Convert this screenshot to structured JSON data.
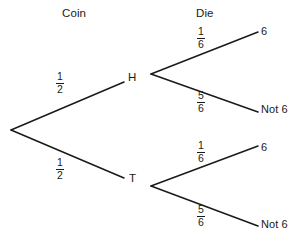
{
  "diagram": {
    "type": "probability-tree",
    "title_columns": [
      {
        "id": "coin",
        "label": "Coin"
      },
      {
        "id": "die",
        "label": "Die"
      }
    ],
    "nodes": {
      "root": {
        "label": ""
      },
      "heads": {
        "label": "H"
      },
      "tails": {
        "label": "T"
      },
      "h_six": {
        "label": "6"
      },
      "h_not_six": {
        "label": "Not 6"
      },
      "t_six": {
        "label": "6"
      },
      "t_not_six": {
        "label": "Not 6"
      }
    },
    "branches": [
      {
        "id": "root-heads",
        "numerator": "1",
        "denominator": "2"
      },
      {
        "id": "root-tails",
        "numerator": "1",
        "denominator": "2"
      },
      {
        "id": "heads-six",
        "numerator": "1",
        "denominator": "6"
      },
      {
        "id": "heads-not-six",
        "numerator": "5",
        "denominator": "6"
      },
      {
        "id": "tails-six",
        "numerator": "1",
        "denominator": "6"
      },
      {
        "id": "tails-not-six",
        "numerator": "5",
        "denominator": "6"
      }
    ],
    "colors": {
      "background": "#ffffff",
      "line": "#1a1a1a",
      "text": "#1a1a1a"
    }
  }
}
